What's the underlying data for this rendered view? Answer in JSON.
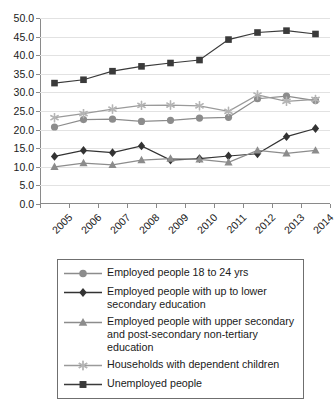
{
  "chart_data": {
    "type": "line",
    "title": "",
    "xlabel": "",
    "ylabel": "",
    "grid": true,
    "legend_position": "bottom",
    "x": [
      "2005",
      "2006",
      "2007",
      "2008",
      "2009",
      "2010",
      "2011",
      "2012",
      "2013",
      "2014"
    ],
    "categories": [
      "2005",
      "2006",
      "2007",
      "2008",
      "2009",
      "2010",
      "2011",
      "2012",
      "2013",
      "2014"
    ],
    "ylim": [
      0.0,
      50.0
    ],
    "ytick_labels": [
      "0.0",
      "5.0",
      "10.0",
      "15.0",
      "20.0",
      "25.0",
      "30.0",
      "35.0",
      "40.0",
      "45.0",
      "50.0"
    ],
    "ytick_values": [
      0.0,
      5.0,
      10.0,
      15.0,
      20.0,
      25.0,
      30.0,
      35.0,
      40.0,
      45.0,
      50.0
    ],
    "series": [
      {
        "name": "Employed people 18 to 24 yrs",
        "marker": "circle",
        "color": "#8c8c8c",
        "line_color": "#8c8c8c",
        "values": [
          20.7,
          22.7,
          22.8,
          22.2,
          22.5,
          23.1,
          23.3,
          28.3,
          29.0,
          27.8
        ]
      },
      {
        "name": "Employed people with up to lower secondary education",
        "marker": "diamond",
        "color": "#333333",
        "line_color": "#333333",
        "values": [
          12.8,
          14.4,
          13.8,
          15.6,
          11.8,
          12.2,
          12.9,
          13.5,
          18.1,
          20.3
        ]
      },
      {
        "name": "Employed people with upper secondary and post-secondary non-tertiary education",
        "marker": "triangle",
        "color": "#8c8c8c",
        "line_color": "#8c8c8c",
        "values": [
          10.0,
          11.0,
          10.5,
          11.8,
          12.2,
          12.0,
          11.2,
          14.4,
          13.6,
          14.4
        ]
      },
      {
        "name": "Households with dependent children",
        "marker": "star",
        "color": "#b5b5b5",
        "line_color": "#9a9a9a",
        "values": [
          23.2,
          24.3,
          25.5,
          26.5,
          26.6,
          26.4,
          24.9,
          29.3,
          27.6,
          28.1
        ]
      },
      {
        "name": "Unemployed people",
        "marker": "square",
        "color": "#3a3a3a",
        "line_color": "#3a3a3a",
        "values": [
          32.5,
          33.4,
          35.7,
          37.0,
          37.9,
          38.7,
          44.2,
          46.1,
          46.6,
          45.7
        ]
      }
    ]
  },
  "legend": {
    "items": [
      {
        "label": "Employed people 18 to 24 yrs"
      },
      {
        "label": "Employed people with up to lower secondary education"
      },
      {
        "label": "Employed people with upper secondary and post-secondary non-tertiary education"
      },
      {
        "label": "Households with dependent children"
      },
      {
        "label": "Unemployed people"
      }
    ]
  }
}
